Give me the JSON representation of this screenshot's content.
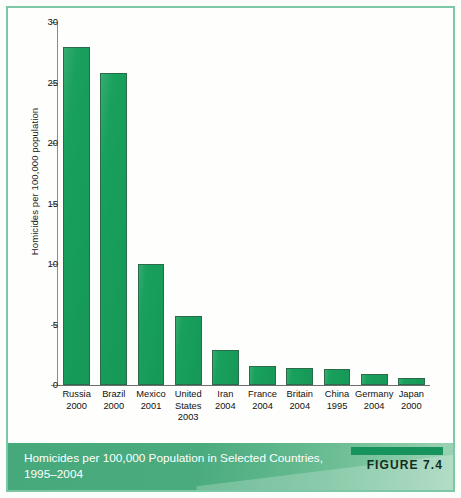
{
  "figure": {
    "caption": "Homicides per 100,000 Population in Selected Countries, 1995–2004",
    "figure_label": "FIGURE 7.4",
    "frame_color": "#7cc8a6",
    "band_color": "#4aab7e",
    "bar_color": "#18a05c",
    "bar_outline_color": "#2b6b4b"
  },
  "chart_data": {
    "type": "bar",
    "title": "",
    "xlabel": "",
    "ylabel": "Homicides per 100,000 population",
    "ylim": [
      0,
      30
    ],
    "yticks": [
      0,
      5,
      10,
      15,
      20,
      25,
      30
    ],
    "ytick_labels": [
      "0",
      "5",
      "10",
      "15",
      "20",
      "25",
      "30"
    ],
    "grid": false,
    "legend": "none",
    "categories": [
      "Russia 2000",
      "Brazil 2000",
      "Mexico 2001",
      "United States 2003",
      "Iran 2004",
      "France 2004",
      "Britain 2004",
      "China 1995",
      "Germany 2004",
      "Japan 2000"
    ],
    "country_labels": [
      "Russia",
      "Brazil",
      "Mexico",
      "United States",
      "Iran",
      "France",
      "Britain",
      "China",
      "Germany",
      "Japan"
    ],
    "year_labels": [
      "2000",
      "2000",
      "2001",
      "2003",
      "2004",
      "2004",
      "2004",
      "1995",
      "2004",
      "2000"
    ],
    "values": [
      27.9,
      25.8,
      10.0,
      5.7,
      2.9,
      1.6,
      1.4,
      1.3,
      0.9,
      0.6
    ]
  }
}
